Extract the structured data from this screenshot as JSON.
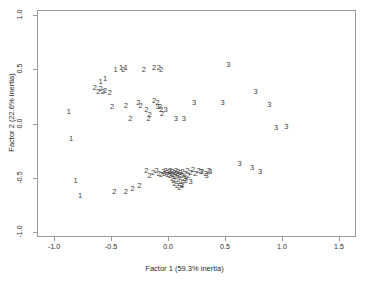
{
  "chart_data": {
    "type": "scatter",
    "title": "",
    "xlabel": "Factor 1 (59.3% inertia)",
    "ylabel": "Factor 2 (22.6% inertia)",
    "xlim": [
      -1.15,
      1.65
    ],
    "ylim": [
      -1.05,
      1.05
    ],
    "xticks": [
      -1.0,
      -0.5,
      0.0,
      0.5,
      1.0,
      1.5
    ],
    "xticklabels": [
      "-1.0",
      "-0.5",
      "0.0",
      "0.5",
      "1.0",
      "1.5"
    ],
    "yticks": [
      -1.0,
      -0.5,
      0.0,
      0.5,
      1.0
    ],
    "yticklabels": [
      "-1.0",
      "-0.5",
      "0.0",
      "0.5",
      "1.0"
    ],
    "grid": false,
    "legend": null,
    "marker_style": "text-label",
    "series": [
      {
        "name": "Group 1",
        "label": "1",
        "points": [
          [
            -0.88,
            0.12
          ],
          [
            -0.86,
            -0.13
          ],
          [
            -0.82,
            -0.52
          ],
          [
            -0.78,
            -0.66
          ],
          [
            -0.6,
            0.39
          ],
          [
            -0.56,
            0.42
          ],
          [
            -0.47,
            0.5
          ],
          [
            -0.42,
            0.52
          ],
          [
            -0.38,
            0.52
          ]
        ]
      },
      {
        "name": "Group 2",
        "label": "2",
        "points": [
          [
            -0.65,
            0.34
          ],
          [
            -0.62,
            0.3
          ],
          [
            -0.6,
            0.33
          ],
          [
            -0.58,
            0.3
          ],
          [
            -0.56,
            0.31
          ],
          [
            -0.52,
            0.29
          ],
          [
            -0.5,
            0.16
          ],
          [
            -0.4,
            0.5
          ],
          [
            -0.38,
            0.17
          ],
          [
            -0.34,
            0.05
          ],
          [
            -0.27,
            0.2
          ],
          [
            -0.25,
            0.17
          ],
          [
            -0.22,
            0.5
          ],
          [
            -0.2,
            0.13
          ],
          [
            -0.18,
            0.05
          ],
          [
            -0.17,
            0.09
          ],
          [
            -0.13,
            0.52
          ],
          [
            -0.09,
            0.52
          ],
          [
            -0.07,
            0.5
          ],
          [
            -0.13,
            0.22
          ],
          [
            -0.1,
            0.2
          ],
          [
            -0.08,
            0.16
          ],
          [
            -0.07,
            0.13
          ],
          [
            -0.06,
            0.1
          ],
          [
            -0.48,
            -0.62
          ],
          [
            -0.38,
            -0.62
          ],
          [
            -0.32,
            -0.6
          ],
          [
            -0.26,
            -0.57
          ],
          [
            -0.2,
            -0.43
          ],
          [
            -0.17,
            -0.48
          ],
          [
            -0.14,
            -0.45
          ],
          [
            -0.11,
            -0.43
          ],
          [
            -0.09,
            -0.46
          ],
          [
            -0.07,
            -0.47
          ],
          [
            -0.05,
            -0.44
          ],
          [
            -0.04,
            -0.46
          ],
          [
            -0.03,
            -0.43
          ],
          [
            -0.02,
            -0.45
          ],
          [
            -0.01,
            -0.47
          ],
          [
            0.0,
            -0.44
          ],
          [
            0.01,
            -0.48
          ],
          [
            0.01,
            -0.43
          ],
          [
            0.02,
            -0.46
          ],
          [
            0.03,
            -0.5
          ],
          [
            0.03,
            -0.44
          ],
          [
            0.04,
            -0.47
          ],
          [
            0.04,
            -0.52
          ],
          [
            0.05,
            -0.45
          ],
          [
            0.05,
            -0.55
          ],
          [
            0.06,
            -0.43
          ],
          [
            0.06,
            -0.49
          ],
          [
            0.07,
            -0.46
          ],
          [
            0.07,
            -0.57
          ],
          [
            0.08,
            -0.44
          ],
          [
            0.08,
            -0.51
          ],
          [
            0.09,
            -0.47
          ],
          [
            0.09,
            -0.59
          ],
          [
            0.1,
            -0.45
          ],
          [
            0.1,
            -0.53
          ],
          [
            0.11,
            -0.48
          ],
          [
            0.12,
            -0.44
          ],
          [
            0.12,
            -0.56
          ],
          [
            0.13,
            -0.5
          ],
          [
            0.14,
            -0.46
          ],
          [
            0.15,
            -0.52
          ],
          [
            0.16,
            -0.43
          ],
          [
            0.17,
            -0.48
          ],
          [
            0.19,
            -0.45
          ],
          [
            0.21,
            -0.42
          ],
          [
            0.23,
            -0.46
          ],
          [
            0.26,
            -0.43
          ],
          [
            0.29,
            -0.44
          ],
          [
            0.32,
            -0.46
          ],
          [
            0.35,
            -0.43
          ]
        ]
      },
      {
        "name": "Group 3",
        "label": "3",
        "points": [
          [
            -0.1,
            0.16
          ],
          [
            -0.03,
            0.13
          ],
          [
            0.06,
            0.05
          ],
          [
            0.13,
            0.05
          ],
          [
            0.22,
            0.2
          ],
          [
            0.47,
            0.2
          ],
          [
            0.52,
            0.55
          ],
          [
            0.76,
            0.3
          ],
          [
            0.88,
            0.18
          ],
          [
            0.94,
            -0.03
          ],
          [
            1.03,
            -0.02
          ],
          [
            0.73,
            -0.4
          ],
          [
            0.8,
            -0.44
          ],
          [
            0.62,
            -0.37
          ],
          [
            0.28,
            -0.44
          ],
          [
            0.33,
            -0.48
          ],
          [
            0.36,
            -0.44
          ],
          [
            0.19,
            -0.53
          ],
          [
            0.11,
            -0.57
          ],
          [
            0.14,
            -0.5
          ]
        ]
      }
    ]
  }
}
